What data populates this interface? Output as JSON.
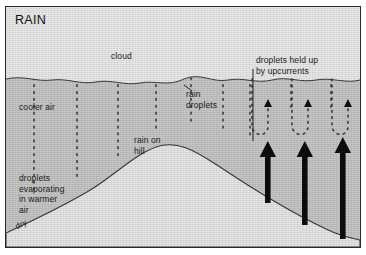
{
  "figure": {
    "title": "RAIN",
    "width": 366,
    "height": 255
  },
  "colors": {
    "page_background": "#ffffff",
    "frame_border": "#2b2b2b",
    "sky": "#e9e9e9",
    "cloud_body": "#c6c6c6",
    "hill_fill": "#e6e6e6",
    "outline": "#3a3a3a",
    "droplet": "#3c3c3c",
    "arrow": "#0d0d0d",
    "text": "#1a1a1a"
  },
  "labels": {
    "cloud": "cloud",
    "cooler_air": "cooler air",
    "rain_droplets": "rain\ndroplets",
    "rain_on_hill": "rain on\nhill",
    "evaporating": "droplets\nevaporating\nin warmer\nair",
    "held_up": "droplets held up\nby upcurrents",
    "dry": "dry"
  },
  "diagram": {
    "type": "illustrated-cross-section",
    "regions": [
      {
        "name": "sky",
        "description": "light grey area above cloud base"
      },
      {
        "name": "cloud-body",
        "description": "darker grey saturated cloud mass below wavy cloud base"
      },
      {
        "name": "hill",
        "description": "light triangular hill peaking left-of-centre"
      }
    ],
    "rain_columns_x": [
      33,
      76,
      117,
      155,
      190,
      222,
      249,
      290,
      330
    ],
    "upcurrent_arrows_x": [
      268,
      305,
      342
    ],
    "held_droplet_loops_x": [
      258,
      297,
      337
    ],
    "cloud_base_y": 78
  }
}
